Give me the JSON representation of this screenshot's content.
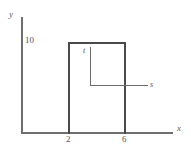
{
  "chart_data": {
    "type": "line",
    "title": "",
    "xlabel": "x",
    "ylabel": "y",
    "xlim": [
      0,
      10
    ],
    "ylim": [
      0,
      12
    ],
    "grid": false,
    "legend": "none",
    "x_tick_labels": [
      "2",
      "6"
    ],
    "y_tick_labels": [
      "10"
    ],
    "x_ticks": [
      2,
      6
    ],
    "y_ticks": [
      10
    ],
    "series": [
      {
        "name": "rectangular pulse",
        "x": [
          2,
          2,
          6,
          6
        ],
        "y": [
          0,
          10,
          10,
          0
        ],
        "description": "Rectangular pulse of height 10 spanning x from 2 to 6"
      }
    ],
    "annotations": [
      {
        "label": "t",
        "kind": "leader-label",
        "description": "italic t labelling the vertical leader line inside the pulse"
      },
      {
        "label": "s",
        "kind": "leader-label",
        "description": "italic s labelling the horizontal leader line pointing right out of the pulse"
      }
    ]
  },
  "axes": {
    "y_name": "y",
    "x_name": "x"
  },
  "ticks": {
    "y_10": "10",
    "x_2": "2",
    "x_6": "6"
  },
  "annotations": {
    "t": "t",
    "s": "s"
  },
  "colors": {
    "axis": "#6f6f6f",
    "pulse": "#4a4a4a",
    "leader": "#6a6a6a",
    "text": "#555555",
    "background": "#ffffff"
  }
}
